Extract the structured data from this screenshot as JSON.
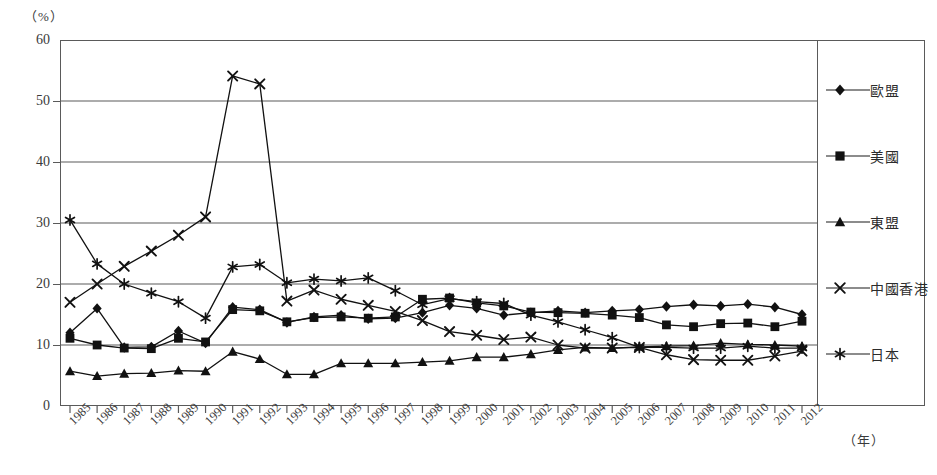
{
  "axes": {
    "y_unit": "（%）",
    "x_unit": "（年）",
    "y_ticks": [
      "60",
      "50",
      "40",
      "30",
      "20",
      "10",
      "0"
    ]
  },
  "legend": {
    "items": [
      {
        "label": "歐盟",
        "marker": "diamond-marker"
      },
      {
        "label": "美國",
        "marker": "square-marker"
      },
      {
        "label": "東盟",
        "marker": "triangle-marker"
      },
      {
        "label": "中國香港",
        "marker": "cross-marker"
      },
      {
        "label": "日本",
        "marker": "asterisk-marker"
      }
    ]
  },
  "chart_data": {
    "type": "line",
    "title": "",
    "xlabel": "（年）",
    "ylabel": "（%）",
    "ylim": [
      0,
      60
    ],
    "ytick_step": 10,
    "grid": true,
    "legend_position": "right",
    "categories": [
      "1985",
      "1986",
      "1987",
      "1988",
      "1989",
      "1990",
      "1991",
      "1992",
      "1993",
      "1994",
      "1995",
      "1996",
      "1997",
      "1998",
      "1999",
      "2000",
      "2001",
      "2002",
      "2003",
      "2004",
      "2005",
      "2006",
      "2007",
      "2008",
      "2009",
      "2010",
      "2011",
      "2012"
    ],
    "series": [
      {
        "name": "歐盟",
        "marker": "diamond-marker",
        "values": [
          12.0,
          16.0,
          9.6,
          9.7,
          12.3,
          10.3,
          16.2,
          15.8,
          13.7,
          14.6,
          14.9,
          14.3,
          14.4,
          15.3,
          16.5,
          16.0,
          14.9,
          15.3,
          15.6,
          15.3,
          15.6,
          15.8,
          16.3,
          16.6,
          16.4,
          16.7,
          16.2,
          15.0
        ]
      },
      {
        "name": "美國",
        "marker": "square-marker",
        "values": [
          11.1,
          10.0,
          9.5,
          9.4,
          11.1,
          10.5,
          15.8,
          15.6,
          13.8,
          14.5,
          14.6,
          14.4,
          14.6,
          17.5,
          17.7,
          16.9,
          16.4,
          15.4,
          15.3,
          15.2,
          14.9,
          14.5,
          13.3,
          13.0,
          13.5,
          13.6,
          13.0,
          13.9
        ]
      },
      {
        "name": "東盟",
        "marker": "triangle-marker",
        "values": [
          5.7,
          4.9,
          5.3,
          5.4,
          5.8,
          5.7,
          8.9,
          7.7,
          5.2,
          5.2,
          7.0,
          7.0,
          7.0,
          7.2,
          7.4,
          8.0,
          8.0,
          8.5,
          9.2,
          9.6,
          9.5,
          9.7,
          9.8,
          9.9,
          10.3,
          10.1,
          10.0,
          9.8
        ]
      },
      {
        "name": "中國香港",
        "marker": "cross-marker",
        "values": [
          17.0,
          20.0,
          22.9,
          25.4,
          28.0,
          31.0,
          54.1,
          52.8,
          17.2,
          19.0,
          17.5,
          16.5,
          15.5,
          14.0,
          12.2,
          11.6,
          10.9,
          11.3,
          10.0,
          9.5,
          9.5,
          9.6,
          8.4,
          7.6,
          7.5,
          7.5,
          8.2,
          9.0
        ]
      },
      {
        "name": "日本",
        "marker": "asterisk-marker",
        "values": [
          30.5,
          23.3,
          20.0,
          18.5,
          17.1,
          14.4,
          22.8,
          23.2,
          20.2,
          20.8,
          20.5,
          21.0,
          18.9,
          16.6,
          17.6,
          17.1,
          16.8,
          14.9,
          13.8,
          12.5,
          11.2,
          9.6,
          9.6,
          9.5,
          9.5,
          9.8,
          9.5,
          9.5
        ]
      }
    ]
  }
}
